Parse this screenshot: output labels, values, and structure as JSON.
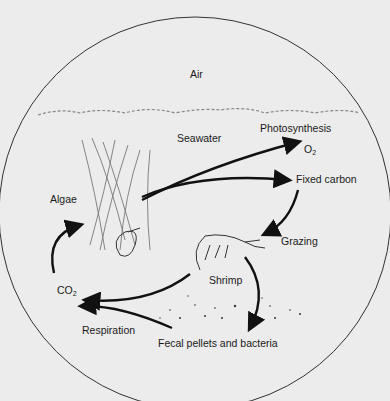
{
  "diagram": {
    "regions": {
      "air": "Air",
      "seawater": "Seawater"
    },
    "organisms": {
      "algae": "Algae",
      "shrimp": "Shrimp"
    },
    "processes": {
      "photosynthesis": "Photosynthesis",
      "grazing": "Grazing",
      "respiration": "Respiration"
    },
    "substances": {
      "o2": "O",
      "o2_sub": "2",
      "fixed_carbon": "Fixed carbon",
      "co2": "CO",
      "co2_sub": "2",
      "fecal": "Fecal pellets and bacteria"
    },
    "colors": {
      "background": "#ececec",
      "ink": "#111111"
    }
  }
}
